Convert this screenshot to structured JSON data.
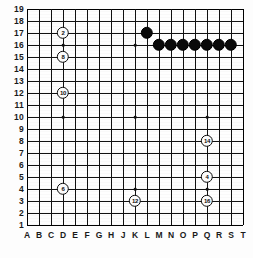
{
  "diagram": {
    "type": "go-board",
    "board_size": 19,
    "column_labels": [
      "A",
      "B",
      "C",
      "D",
      "E",
      "F",
      "G",
      "H",
      "J",
      "K",
      "L",
      "M",
      "N",
      "O",
      "P",
      "Q",
      "R",
      "S",
      "T"
    ],
    "row_labels": [
      "19",
      "18",
      "17",
      "16",
      "15",
      "14",
      "13",
      "12",
      "11",
      "10",
      "9",
      "8",
      "7",
      "6",
      "5",
      "4",
      "3",
      "2",
      "1"
    ],
    "colors": {
      "line": "#111111",
      "black_stone": "#0a0a0a",
      "white_stone_fill": "#fbfbfb",
      "white_stone_border": "#0d0d0d",
      "background": "#fefefe"
    },
    "hoshi_points": [
      {
        "col": "D",
        "row": 16
      },
      {
        "col": "K",
        "row": 16
      },
      {
        "col": "Q",
        "row": 16
      },
      {
        "col": "D",
        "row": 10
      },
      {
        "col": "K",
        "row": 10
      },
      {
        "col": "Q",
        "row": 10
      },
      {
        "col": "D",
        "row": 4
      },
      {
        "col": "K",
        "row": 4
      },
      {
        "col": "Q",
        "row": 4
      }
    ],
    "stones": [
      {
        "col": "L",
        "row": 17,
        "color": "black",
        "label": ""
      },
      {
        "col": "M",
        "row": 16,
        "color": "black",
        "label": ""
      },
      {
        "col": "N",
        "row": 16,
        "color": "black",
        "label": ""
      },
      {
        "col": "O",
        "row": 16,
        "color": "black",
        "label": ""
      },
      {
        "col": "P",
        "row": 16,
        "color": "black",
        "label": ""
      },
      {
        "col": "Q",
        "row": 16,
        "color": "black",
        "label": ""
      },
      {
        "col": "R",
        "row": 16,
        "color": "black",
        "label": ""
      },
      {
        "col": "S",
        "row": 16,
        "color": "black",
        "label": ""
      },
      {
        "col": "D",
        "row": 17,
        "color": "white",
        "label": "2"
      },
      {
        "col": "D",
        "row": 15,
        "color": "white",
        "label": "8"
      },
      {
        "col": "D",
        "row": 12,
        "color": "white",
        "label": "10"
      },
      {
        "col": "D",
        "row": 4,
        "color": "white",
        "label": "6"
      },
      {
        "col": "K",
        "row": 3,
        "color": "white",
        "label": "12"
      },
      {
        "col": "Q",
        "row": 8,
        "color": "white",
        "label": "14"
      },
      {
        "col": "Q",
        "row": 5,
        "color": "white",
        "label": "4"
      },
      {
        "col": "Q",
        "row": 3,
        "color": "white",
        "label": "16"
      }
    ],
    "caption": ""
  }
}
